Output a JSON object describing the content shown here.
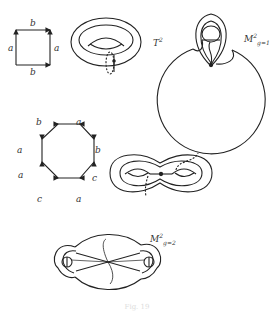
{
  "figure": {
    "caption": "Fig. 19",
    "panels": [
      {
        "id": "square",
        "description": "Square fundamental polygon of the torus",
        "edge_labels": {
          "top": "b",
          "bottom": "b",
          "left": "a",
          "right": "a"
        }
      },
      {
        "id": "torus",
        "description": "Torus with meridian and longitude",
        "label": "T",
        "label_sup": "2"
      },
      {
        "id": "genus1",
        "description": "Sphere with one handle",
        "label": "M",
        "label_sup": "2",
        "label_sub": "g=1"
      },
      {
        "id": "octagon",
        "description": "Octagon fundamental polygon for genus 2",
        "edge_labels": [
          "b",
          "a",
          "b",
          "c",
          "a",
          "c",
          "a",
          "a"
        ]
      },
      {
        "id": "double-torus",
        "description": "Double torus (pretzel) with cycles"
      },
      {
        "id": "genus2",
        "description": "Sphere with two handles",
        "label": "M",
        "label_sup": "2",
        "label_sub": "g=2"
      }
    ]
  }
}
